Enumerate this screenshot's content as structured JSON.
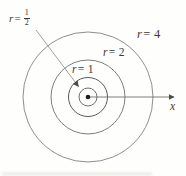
{
  "figure": {
    "background": "#fefefd",
    "text_color": "#3a3a3a",
    "center": {
      "x": 88,
      "y": 97
    },
    "center_dot": {
      "radius": 2.3,
      "color": "#1c1c1c"
    },
    "circles": [
      {
        "name": "r-half",
        "r_value": "1/2",
        "radius": 9,
        "color": "#5f5f5f",
        "width": 0.9
      },
      {
        "name": "r-1",
        "r_value": "1",
        "radius": 19.5,
        "color": "#5a5a5a",
        "width": 1
      },
      {
        "name": "r-2",
        "r_value": "2",
        "radius": 37,
        "color": "#7e7e7e",
        "width": 1
      },
      {
        "name": "r-4",
        "r_value": "4",
        "radius": 65,
        "color": "#8f8f8f",
        "width": 1
      }
    ],
    "axis": {
      "x2": 174,
      "color": "#6f6f6f",
      "width": 0.9
    },
    "leader": {
      "x1": 36,
      "y1": 30,
      "x2": 78.5,
      "y2": 86.5,
      "color": "#999590",
      "width": 0.9
    },
    "arrowhead_color": "#4a4a4a",
    "labels": {
      "r_half": {
        "var": "r",
        "eq": "=",
        "num": "1",
        "den": "2"
      },
      "r_1": {
        "var": "r",
        "rest": "= 1"
      },
      "r_2": {
        "var": "r",
        "rest": "= 2"
      },
      "r_4": {
        "var": "r",
        "rest": "= 4"
      },
      "x_axis": "x"
    }
  }
}
